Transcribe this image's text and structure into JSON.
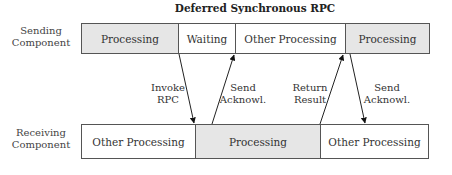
{
  "title": "Deferred Synchronous RPC",
  "rows": {
    "sending": {
      "label_line1": "Sending",
      "label_line2": "Component",
      "segments": [
        {
          "label": "Processing",
          "shaded": true
        },
        {
          "label": "Waiting",
          "shaded": false
        },
        {
          "label": "Other Processing",
          "shaded": false
        },
        {
          "label": "Processing",
          "shaded": true
        }
      ]
    },
    "receiving": {
      "label_line1": "Receiving",
      "label_line2": "Component",
      "segments": [
        {
          "label": "Other Processing",
          "shaded": false
        },
        {
          "label": "Processing",
          "shaded": true
        },
        {
          "label": "Other Processing",
          "shaded": false
        }
      ]
    }
  },
  "messages": [
    {
      "line1": "Invoke",
      "line2": "RPC",
      "direction": "down"
    },
    {
      "line1": "Send",
      "line2": "Acknowl.",
      "direction": "up"
    },
    {
      "line1": "Return",
      "line2": "Result",
      "direction": "up"
    },
    {
      "line1": "Send",
      "line2": "Acknowl.",
      "direction": "down"
    }
  ],
  "colors": {
    "shaded": "#e6e6e6",
    "border": "#555555"
  }
}
